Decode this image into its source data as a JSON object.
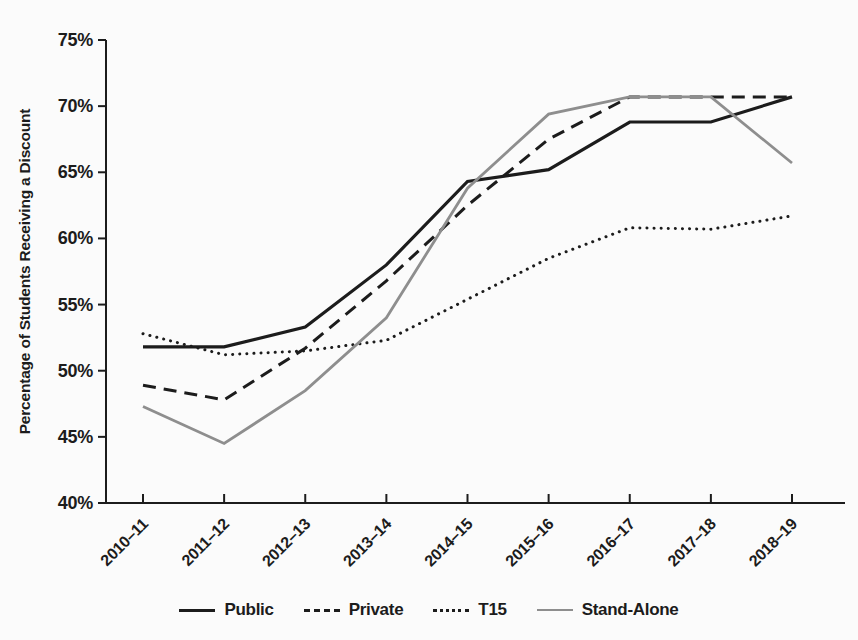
{
  "figure": {
    "background": "#fbfbfb",
    "text_color": "#1c1c1c"
  },
  "chart_data": {
    "type": "line",
    "title": "",
    "xlabel": "",
    "ylabel": "Percentage of Students Receiving a Discount",
    "ylim": [
      40,
      75
    ],
    "y_tick_step": 5,
    "y_tick_labels": [
      "40%",
      "45%",
      "50%",
      "55%",
      "60%",
      "65%",
      "70%",
      "75%"
    ],
    "grid": false,
    "legend_position": "bottom",
    "categories": [
      "2010–11",
      "2011–12",
      "2012–13",
      "2013–14",
      "2014–15",
      "2015–16",
      "2016–17",
      "2017–18",
      "2018–19"
    ],
    "series": [
      {
        "name": "Public",
        "color": "#1c1c1c",
        "style": "solid",
        "width": 3.2,
        "values": [
          51.8,
          51.8,
          53.3,
          58.0,
          64.3,
          65.2,
          68.8,
          68.8,
          70.7
        ]
      },
      {
        "name": "Private",
        "color": "#1c1c1c",
        "style": "dashed",
        "width": 3.0,
        "values": [
          48.9,
          47.8,
          51.7,
          56.8,
          62.5,
          67.5,
          70.7,
          70.7,
          70.7
        ]
      },
      {
        "name": "T15",
        "color": "#1c1c1c",
        "style": "dotted",
        "width": 3.0,
        "values": [
          52.8,
          51.2,
          51.5,
          52.3,
          55.4,
          58.5,
          60.8,
          60.7,
          61.7
        ]
      },
      {
        "name": "Stand-Alone",
        "color": "#8e8e8e",
        "style": "solid",
        "width": 2.8,
        "values": [
          47.3,
          44.5,
          48.5,
          54.0,
          63.8,
          69.4,
          70.7,
          70.7,
          65.7
        ]
      }
    ]
  }
}
